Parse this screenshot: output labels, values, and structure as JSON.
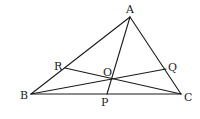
{
  "diagram": {
    "type": "geometry-triangle-cevians",
    "stroke_color": "#1a1a1a",
    "background": "#ffffff",
    "points": {
      "A": {
        "x": 130,
        "y": 17
      },
      "B": {
        "x": 31,
        "y": 94
      },
      "C": {
        "x": 181,
        "y": 94
      },
      "R": {
        "x": 65,
        "y": 68
      },
      "Q": {
        "x": 166,
        "y": 69
      },
      "O": {
        "x": 111,
        "y": 79
      },
      "P": {
        "x": 107,
        "y": 94
      }
    },
    "labels": [
      {
        "id": "A",
        "text": "A",
        "x": 126,
        "y": 13
      },
      {
        "id": "B",
        "text": "B",
        "x": 20,
        "y": 99
      },
      {
        "id": "C",
        "text": "C",
        "x": 184,
        "y": 101
      },
      {
        "id": "R",
        "text": "R",
        "x": 54,
        "y": 70
      },
      {
        "id": "Q",
        "text": "Q",
        "x": 168,
        "y": 71
      },
      {
        "id": "O",
        "text": "O",
        "x": 103,
        "y": 76
      },
      {
        "id": "P",
        "text": "P",
        "x": 101,
        "y": 106
      }
    ],
    "segments": [
      {
        "id": "AB",
        "from": "A",
        "to": "B"
      },
      {
        "id": "AC",
        "from": "A",
        "to": "C"
      },
      {
        "id": "BC",
        "from": "B",
        "to": "C"
      },
      {
        "id": "AP",
        "from": "A",
        "to": "P"
      },
      {
        "id": "BQ",
        "from": "B",
        "to": "Q"
      },
      {
        "id": "CR",
        "from": "C",
        "to": "R"
      }
    ]
  }
}
